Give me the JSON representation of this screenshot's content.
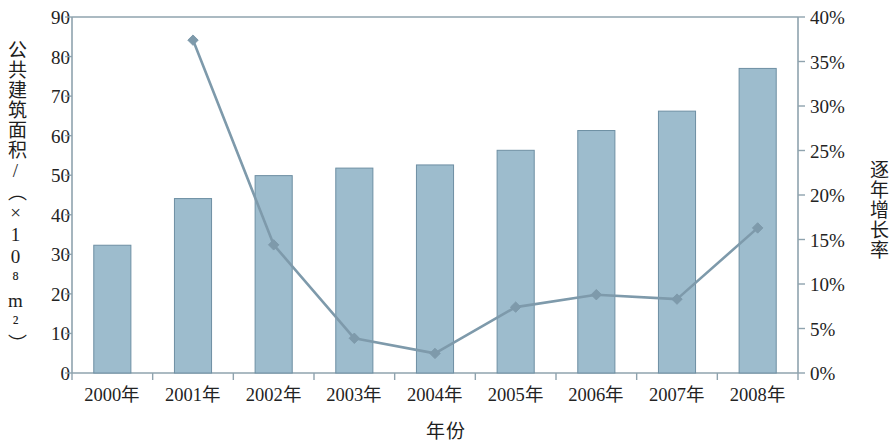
{
  "chart_data": {
    "type": "bar",
    "title": "",
    "xlabel": "年份",
    "ylabel": "公共建筑面积/（×10⁸m²）",
    "y2label": "逐年增长率",
    "categories": [
      "2000年",
      "2001年",
      "2002年",
      "2003年",
      "2004年",
      "2005年",
      "2006年",
      "2007年",
      "2008年"
    ],
    "ylim": [
      0,
      90
    ],
    "y2lim": [
      0,
      40
    ],
    "y_ticks": [
      "0",
      "10",
      "20",
      "30",
      "40",
      "50",
      "60",
      "70",
      "80",
      "90"
    ],
    "y_tick_values": [
      0,
      10,
      20,
      30,
      40,
      50,
      60,
      70,
      80,
      90
    ],
    "y2_ticks": [
      "0%",
      "5%",
      "10%",
      "15%",
      "20%",
      "25%",
      "30%",
      "35%",
      "40%"
    ],
    "y2_tick_values": [
      0,
      5,
      10,
      15,
      20,
      25,
      30,
      35,
      40
    ],
    "grid": false,
    "legend": "none",
    "series": [
      {
        "name": "公共建筑面积",
        "kind": "bar",
        "axis": "left",
        "color": "#9dbccd",
        "edge_color": "#6e8fa3",
        "values": [
          32.3,
          44.1,
          49.9,
          51.8,
          52.6,
          56.3,
          61.3,
          66.2,
          77.0
        ]
      },
      {
        "name": "逐年增长率",
        "kind": "line",
        "axis": "right",
        "color": "#7e9aab",
        "marker": "diamond",
        "values": [
          null,
          37.4,
          14.4,
          3.9,
          2.2,
          7.4,
          8.8,
          8.3,
          16.3
        ]
      }
    ]
  },
  "colors": {
    "bar_fill": "#9dbccd",
    "bar_edge": "#6e8fa3",
    "line": "#7e9aab",
    "axis": "#8fa3ae",
    "text": "#232323"
  }
}
